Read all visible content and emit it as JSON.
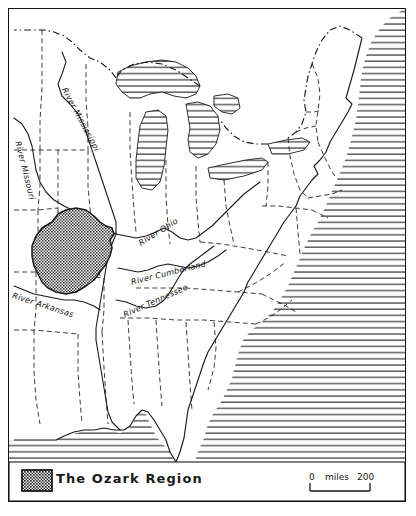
{
  "figure": {
    "kind": "reference-map",
    "title": "The Ozark Region",
    "region_name": "United States (eastern and central)",
    "border_color": "#111111",
    "background_color": "#ffffff",
    "ocean_fill": "horizontal-line-hatch",
    "lake_fill": "horizontal-line-hatch",
    "ozark_fill": "stipple-dot-hatch",
    "ozark_fill_color": "#555555",
    "state_border_style": "dashed",
    "coastline_style": "solid"
  },
  "legend": {
    "swatch_name": "ozark-region-swatch",
    "label": "The Ozark Region"
  },
  "scale_bar": {
    "zero": "0",
    "unit": "miles",
    "max": "200"
  },
  "river_labels": [
    {
      "name": "river-mississippi-label",
      "text": "River Mississippi"
    },
    {
      "name": "river-missouri-label",
      "text": "River Missouri"
    },
    {
      "name": "river-ohio-label",
      "text": "River Ohio"
    },
    {
      "name": "river-cumberland-label",
      "text": "River Cumberland"
    },
    {
      "name": "river-tennessee-label",
      "text": "River Tennessee"
    },
    {
      "name": "river-arkansas-label",
      "text": "River Arkansas"
    }
  ],
  "map_features": {
    "water_bodies": [
      "Lake Superior",
      "Lake Michigan",
      "Lake Huron",
      "Lake Erie",
      "Lake Ontario",
      "Atlantic Ocean",
      "Gulf of Mexico"
    ],
    "highlighted_area": "The Ozark Region"
  }
}
